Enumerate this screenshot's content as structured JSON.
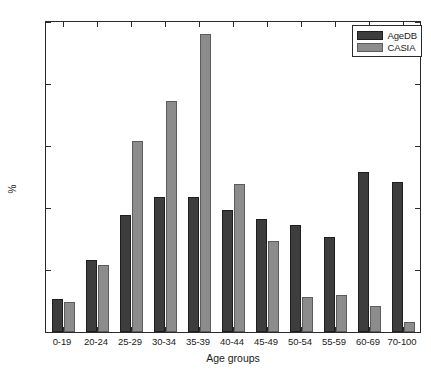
{
  "chart_data": {
    "type": "bar",
    "title": "",
    "xlabel": "Age groups",
    "ylabel": "%",
    "categories": [
      "0-19",
      "20-24",
      "25-29",
      "30-34",
      "35-39",
      "40-44",
      "45-49",
      "50-54",
      "55-59",
      "60-69",
      "70-100"
    ],
    "series": [
      {
        "name": "AgeDB",
        "color": "#3d3d3d",
        "values": [
          0.027,
          0.058,
          0.094,
          0.109,
          0.109,
          0.098,
          0.091,
          0.086,
          0.077,
          0.129,
          0.121
        ]
      },
      {
        "name": "CASIA",
        "color": "#8c8c8c",
        "values": [
          0.024,
          0.054,
          0.154,
          0.186,
          0.24,
          0.119,
          0.073,
          0.028,
          0.03,
          0.021,
          0.008
        ]
      }
    ],
    "ylim": [
      0,
      0.25
    ],
    "yticks": [
      0,
      0.05,
      0.1,
      0.15,
      0.2,
      0.25
    ],
    "ytick_labels": [
      "0",
      "0.05",
      "0.1",
      "0.15",
      "0.2",
      "0.25"
    ],
    "grid": false,
    "legend_position": "top-right"
  },
  "legend": {
    "entries": [
      {
        "label": "AgeDB"
      },
      {
        "label": "CASIA"
      }
    ]
  }
}
